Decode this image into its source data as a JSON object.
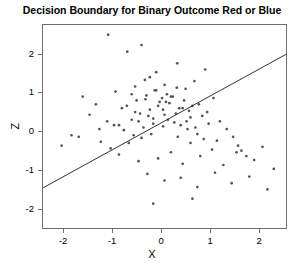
{
  "title": "Decision Boundary for Binary Outcome Red or Blue",
  "axes": {
    "x_title": "X",
    "y_title": "Z",
    "x_ticks": [
      "-2",
      "-1",
      "0",
      "1",
      "2"
    ],
    "y_ticks": [
      "2",
      "1",
      "0",
      "-1",
      "-2"
    ]
  },
  "chart_data": {
    "type": "scatter",
    "title": "Decision Boundary for Binary Outcome Red or Blue",
    "xlabel": "X",
    "ylabel": "Z",
    "xlim": [
      -2.43,
      2.57
    ],
    "ylim": [
      -2.53,
      2.77
    ],
    "x_ticks": [
      -2,
      -1,
      0,
      1,
      2
    ],
    "y_ticks": [
      -2,
      -1,
      0,
      1,
      2
    ],
    "grid": false,
    "legend": null,
    "point_color": "#555555",
    "point_size": 2.0,
    "line_color": "#333333",
    "annotations": [],
    "series": [
      {
        "name": "observations",
        "marker": "point",
        "x": [
          -1.1,
          -0.71,
          -0.42,
          -0.25,
          -0.12,
          0.05,
          0.31,
          0.48,
          0.66,
          0.88,
          -1.62,
          -1.35,
          -0.95,
          -0.62,
          -0.34,
          -0.05,
          0.18,
          0.42,
          0.75,
          1.05,
          -1.85,
          -1.48,
          -1.12,
          -0.82,
          -0.55,
          -0.28,
          0.02,
          0.28,
          0.58,
          0.92,
          -2.05,
          -1.7,
          -1.28,
          -0.88,
          -0.48,
          -0.18,
          0.12,
          0.38,
          0.68,
          1.18,
          -0.72,
          -0.52,
          -0.32,
          -0.15,
          0.0,
          0.15,
          0.35,
          0.55,
          0.82,
          1.32,
          -0.62,
          -0.45,
          -0.25,
          -0.08,
          0.08,
          0.22,
          0.45,
          0.62,
          0.95,
          1.45,
          -0.98,
          -0.78,
          -0.58,
          -0.38,
          -0.18,
          0.05,
          0.25,
          0.52,
          0.85,
          1.55,
          -1.25,
          -1.05,
          -0.68,
          -0.42,
          -0.22,
          0.02,
          0.32,
          0.58,
          1.02,
          1.72,
          -0.55,
          -0.35,
          -0.12,
          0.1,
          0.3,
          0.5,
          0.72,
          1.12,
          1.62,
          2.05,
          -0.88,
          -0.48,
          -0.08,
          0.18,
          0.42,
          0.78,
          1.25,
          1.52,
          1.88,
          2.28,
          -0.3,
          0.05,
          0.38,
          0.72,
          1.08,
          1.42,
          1.78,
          2.15,
          0.62,
          -0.18
        ],
        "y": [
          2.52,
          2.08,
          2.25,
          1.42,
          1.55,
          1.22,
          1.78,
          1.12,
          1.32,
          1.62,
          0.92,
          0.72,
          1.05,
          0.98,
          0.85,
          0.78,
          0.92,
          0.62,
          0.72,
          0.88,
          -0.08,
          0.45,
          0.28,
          0.62,
          0.52,
          0.42,
          0.58,
          0.48,
          0.38,
          0.52,
          -0.35,
          -0.12,
          0.08,
          0.18,
          0.28,
          0.22,
          0.32,
          0.18,
          0.12,
          0.28,
          0.68,
          0.82,
          0.95,
          1.08,
          0.88,
          0.75,
          0.62,
          0.55,
          0.42,
          0.08,
          0.32,
          0.48,
          0.58,
          0.68,
          0.78,
          0.92,
          0.82,
          0.68,
          0.22,
          -0.12,
          0.18,
          0.05,
          -0.08,
          0.12,
          0.35,
          0.45,
          0.25,
          0.08,
          -0.18,
          -0.35,
          -0.25,
          -0.42,
          -0.28,
          -0.15,
          -0.05,
          0.15,
          -0.12,
          -0.28,
          -0.45,
          -0.62,
          1.18,
          1.35,
          1.08,
          0.98,
          1.15,
          0.28,
          -0.05,
          -0.22,
          -0.48,
          -0.38,
          -0.58,
          -0.75,
          -0.68,
          -0.52,
          -0.82,
          -0.62,
          -0.85,
          -0.52,
          -0.72,
          -0.95,
          -1.08,
          -1.25,
          -1.18,
          -1.42,
          -1.05,
          -1.32,
          -1.15,
          -1.48,
          -1.72,
          -1.85
        ]
      }
    ],
    "decision_boundary": {
      "type": "line",
      "slope": 0.695,
      "intercept": 0.25,
      "x_start": -2.43,
      "y_start": -1.44,
      "x_end": 2.57,
      "y_end": 2.04
    }
  }
}
